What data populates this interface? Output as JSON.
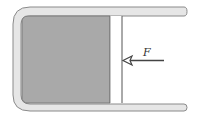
{
  "diagram": {
    "type": "piston-cylinder",
    "force_label": "F",
    "colors": {
      "wall_fill": "#e6e6e6",
      "wall_stroke": "#8a8a8a",
      "gas_fill": "#a9a9a9",
      "gas_stroke": "#707070",
      "piston_fill": "#ffffff",
      "piston_stroke": "#555555",
      "arrow": "#444444"
    }
  }
}
